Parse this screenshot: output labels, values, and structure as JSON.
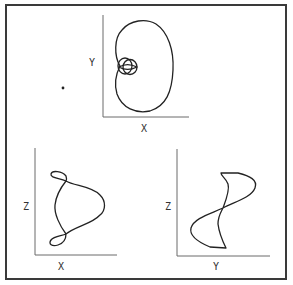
{
  "figure": {
    "panels": [
      {
        "id": "xy",
        "xlabel": "X",
        "ylabel": "Y",
        "description": "projection onto X-Y plane: kidney-shaped orbit with small inner double loop"
      },
      {
        "id": "xz",
        "xlabel": "X",
        "ylabel": "Z",
        "description": "projection onto X-Z plane: pear-shaped curve with small loops at top and bottom"
      },
      {
        "id": "yz",
        "xlabel": "Y",
        "ylabel": "Z",
        "description": "projection onto Y-Z plane: S-shaped figure-eight crossing at center"
      }
    ],
    "marker": {
      "label": "point"
    }
  },
  "colors": {
    "ink": "#222222",
    "axis": "#6a6a6a",
    "frame": "#3a3a3a",
    "background": "#ffffff"
  }
}
